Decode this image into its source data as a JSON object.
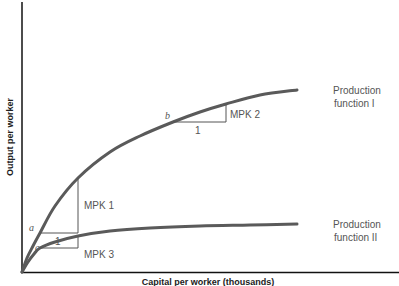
{
  "chart_data": {
    "type": "line",
    "title": "",
    "xlabel": "Capital per worker (thousands)",
    "ylabel": "Output per worker",
    "grid": false,
    "legend_position": "inline-right",
    "series": [
      {
        "name": "Production function I",
        "label_lines": [
          "Production",
          "function I"
        ],
        "color": "#555555",
        "points": [
          [
            22,
            272
          ],
          [
            27,
            258
          ],
          [
            33,
            246
          ],
          [
            40,
            233
          ],
          [
            55,
            206
          ],
          [
            78,
            178
          ],
          [
            110,
            152
          ],
          [
            140,
            136
          ],
          [
            173,
            122
          ],
          [
            200,
            112
          ],
          [
            226,
            104
          ],
          [
            260,
            95
          ],
          [
            297,
            90
          ]
        ]
      },
      {
        "name": "Production function II",
        "label_lines": [
          "Production",
          "function II"
        ],
        "color": "#555555",
        "points": [
          [
            22,
            272
          ],
          [
            28,
            262
          ],
          [
            34,
            254
          ],
          [
            40,
            248
          ],
          [
            55,
            242
          ],
          [
            78,
            236
          ],
          [
            110,
            231
          ],
          [
            150,
            228
          ],
          [
            200,
            226
          ],
          [
            250,
            225
          ],
          [
            297,
            224
          ]
        ]
      }
    ],
    "annotations": [
      {
        "point": "a",
        "x": 40,
        "y": 233,
        "run_label": "1",
        "rise_label": "MPK 1",
        "run_to_x": 78,
        "rise_to_y": 178
      },
      {
        "point": "b",
        "x": 173,
        "y": 122,
        "run_label": "1",
        "rise_label": "MPK 2",
        "run_to_x": 226,
        "rise_to_y": 104
      },
      {
        "point": "c",
        "x": 40,
        "y": 248,
        "run_label": "",
        "rise_label": "MPK 3",
        "run_to_x": 78,
        "rise_to_y": 236
      }
    ]
  },
  "labels": {
    "y_axis": "Output per worker",
    "x_axis": "Capital per worker (thousands)",
    "pf1_line1": "Production",
    "pf1_line2": "function I",
    "pf2_line1": "Production",
    "pf2_line2": "function II",
    "point_a": "a",
    "point_b": "b",
    "point_c": "c",
    "mpk1": "MPK 1",
    "mpk2": "MPK 2",
    "mpk3": "MPK 3",
    "run_a": "1",
    "run_b": "1"
  }
}
